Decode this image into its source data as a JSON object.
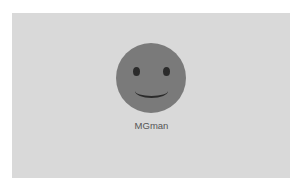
{
  "profile": {
    "username": "MGman",
    "avatar_icon": "smiley-face-icon"
  },
  "colors": {
    "panel_background": "#d9d9d9",
    "avatar_fill": "#7a7a7a",
    "face_features": "#2b2b2b",
    "username_text": "#555555"
  }
}
